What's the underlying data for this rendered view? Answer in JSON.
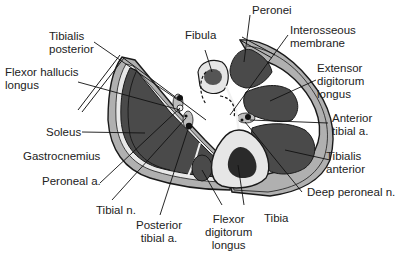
{
  "figure": {
    "type": "anatomical cross-section"
  },
  "colors": {
    "muscle": "#4a4a4a",
    "muscle_outline": "#1a1a1a",
    "skin_layer": "#b0b0b0",
    "fascia": "#e8e8e8",
    "bone_cortex": "#e6e6e6",
    "bone_marrow": "#2a2a2a",
    "background": "#ffffff",
    "leader_line": "#111111"
  },
  "labels": {
    "peronei": [
      "Peronei"
    ],
    "fibula": [
      "Fibula"
    ],
    "interosseous_membrane": [
      "Interosseous",
      "membrane"
    ],
    "tibialis_posterior": [
      "Tibialis",
      "posterior"
    ],
    "flexor_hallucis_longus": [
      "Flexor hallucis",
      "longus"
    ],
    "extensor_digitorum_longus": [
      "Extensor",
      "digitorum",
      "longus"
    ],
    "anterior_tibial_a": [
      "Anterior",
      "tibial a."
    ],
    "soleus": [
      "Soleus"
    ],
    "gastrocnemius": [
      "Gastrocnemius"
    ],
    "tibialis_anterior": [
      "Tibialis",
      "anterior"
    ],
    "peroneal_a": [
      "Peroneal a."
    ],
    "deep_peroneal_n": [
      "Deep peroneal n."
    ],
    "tibial_n": [
      "Tibial n."
    ],
    "posterior_tibial_a": [
      "Posterior",
      "tibial a."
    ],
    "flexor_digitorum_longus": [
      "Flexor",
      "digitorum",
      "longus"
    ],
    "tibia": [
      "Tibia"
    ]
  }
}
